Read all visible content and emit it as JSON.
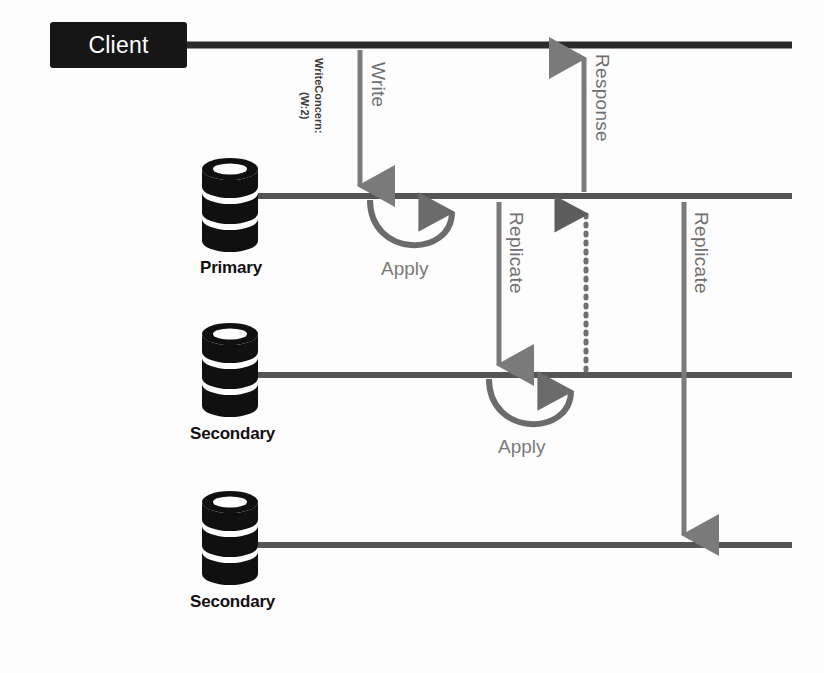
{
  "diagram": {
    "colors": {
      "client_box_fill": "#161616",
      "client_text": "#ffffff",
      "lifeline": "#4f4f4f",
      "cylinder": "#101010",
      "arrow_gray": "#7a7a7a",
      "arrow_dark": "#5d5d5d",
      "label_dark": "#111111",
      "label_gray": "#6f6f6f",
      "background": "#fdfdfd"
    },
    "actors": [
      {
        "id": "client",
        "label": "Client",
        "type": "box",
        "lifeline_y": 45
      },
      {
        "id": "primary",
        "label": "Primary",
        "type": "database",
        "lifeline_y": 196
      },
      {
        "id": "secondary1",
        "label": "Secondary",
        "type": "database",
        "lifeline_y": 375
      },
      {
        "id": "secondary2",
        "label": "Secondary",
        "type": "database",
        "lifeline_y": 545
      }
    ],
    "messages": [
      {
        "id": "write",
        "label": "Write",
        "from": "client",
        "to": "primary",
        "direction": "down",
        "style": "solid"
      },
      {
        "id": "write-concern",
        "label": "WriteConcern:",
        "sublabel": "(W:2)",
        "from": "client",
        "to": "primary",
        "direction": "down",
        "style": "annotation"
      },
      {
        "id": "replicate-1",
        "label": "Replicate",
        "from": "primary",
        "to": "secondary1",
        "direction": "down",
        "style": "solid"
      },
      {
        "id": "apply-1",
        "label": "Apply",
        "on": "primary",
        "direction": "self",
        "style": "curved"
      },
      {
        "id": "apply-2",
        "label": "Apply",
        "on": "secondary1",
        "direction": "self",
        "style": "curved"
      },
      {
        "id": "ack",
        "label": "",
        "from": "secondary1",
        "to": "primary",
        "direction": "up",
        "style": "dotted"
      },
      {
        "id": "response",
        "label": "Response",
        "from": "primary",
        "to": "client",
        "direction": "up",
        "style": "solid"
      },
      {
        "id": "replicate-2",
        "label": "Replicate",
        "from": "primary",
        "to": "secondary2",
        "direction": "down",
        "style": "solid"
      }
    ]
  }
}
